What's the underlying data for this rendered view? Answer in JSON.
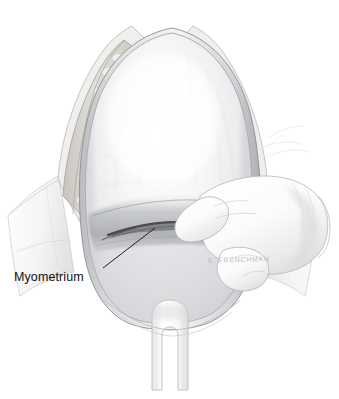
{
  "figure": {
    "background_color": "#ffffff",
    "width": 339,
    "height": 399,
    "medium": "graphite / pencil medical illustration",
    "view": "surgeon's view of exposed uterus through abdominal incision"
  },
  "labels": [
    {
      "id": "myometrium",
      "text": "Myometrium",
      "color": "#111111",
      "leader_from": [
        103,
        268
      ],
      "leader_to": [
        155,
        228
      ]
    }
  ],
  "signature": {
    "text": "E. FRENCHMAN",
    "color": "#b9bcc0"
  },
  "anatomy": {
    "structures": [
      {
        "name": "uterus-body",
        "label": "Uterine body (corpus)",
        "fill": "#f3f3f4",
        "description": "Large pale dome-shaped gravid uterus filling the exposed field"
      },
      {
        "name": "myometrium",
        "label": "Myometrium",
        "fill": "#c9cacd",
        "description": "Muscular uterine wall being incised in the lower uterine segment"
      },
      {
        "name": "lower-uterine-segment",
        "label": "Lower uterine segment",
        "fill": "#b0b2b6",
        "description": "Darker shaded transverse zone where the scalpel incision is made"
      },
      {
        "name": "uterine-incision",
        "label": "Transverse uterine incision",
        "fill": "#4a4c50",
        "description": "Dark horizontal cut line made by the scalpel blade"
      },
      {
        "name": "subcutaneous-fat",
        "label": "Subcutaneous fat",
        "fill": "#d8d6d2",
        "description": "Lobular fatty tissue layer along the retracted abdominal wall edges"
      },
      {
        "name": "abdominal-wall-left",
        "label": "Retracted abdominal wall (left)",
        "fill": "#e4e4e4"
      },
      {
        "name": "abdominal-wall-right",
        "label": "Retracted abdominal wall (right)",
        "fill": "#e4e4e4"
      },
      {
        "name": "surgical-drape",
        "label": "Surgical drape",
        "fill": "#fafafa"
      },
      {
        "name": "bladder-retractor",
        "label": "Bladder retractor",
        "fill": "#fdfdfd",
        "description": "Forked retractor blade below the lower uterine segment"
      },
      {
        "name": "gloved-hand",
        "label": "Surgeon's gloved hand",
        "fill": "#fcfcfc",
        "description": "Hand entering from the right holding the scalpel"
      },
      {
        "name": "scalpel",
        "label": "Scalpel",
        "fill": "#c7c9cc",
        "description": "Ridged-handle scalpel with blade at the uterine incision"
      }
    ]
  },
  "palette": {
    "paper": "#ffffff",
    "line": "#6e7073",
    "line_dark": "#3c3e42",
    "tissue_light": "#f1f1f2",
    "tissue_mid": "#d2d3d6",
    "tissue_dark": "#9b9da1",
    "incision": "#4a4c50",
    "fat": "#d9d7d3",
    "label": "#111111",
    "signature": "#b9bcc0"
  }
}
